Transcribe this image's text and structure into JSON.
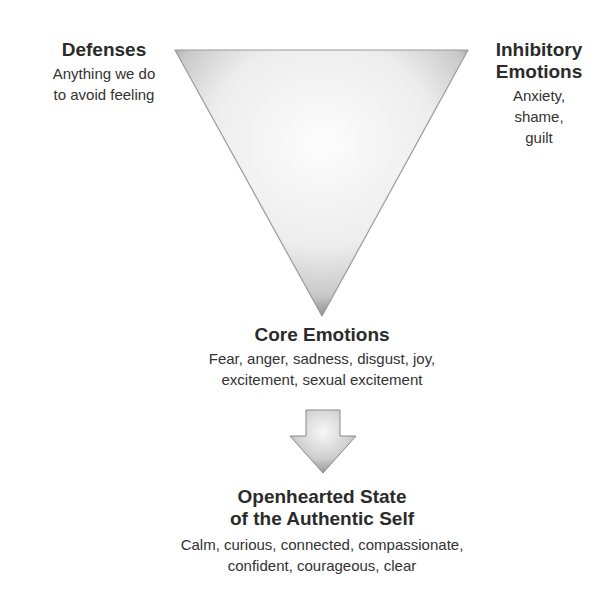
{
  "diagram": {
    "type": "triangle-of-experience",
    "top_left": {
      "title": "Defenses",
      "lines": [
        "Anything we do",
        "to avoid feeling"
      ]
    },
    "top_right": {
      "title_lines": [
        "Inhibitory",
        "Emotions"
      ],
      "lines": [
        "Anxiety,",
        "shame,",
        "guilt"
      ]
    },
    "bottom": {
      "title": "Core Emotions",
      "lines": [
        "Fear, anger, sadness, disgust, joy,",
        "excitement, sexual excitement"
      ]
    },
    "arrow": {
      "icon": "down-arrow-icon",
      "direction": "down"
    },
    "result": {
      "title_lines": [
        "Openhearted State",
        "of the Authentic Self"
      ],
      "lines": [
        "Calm, curious, connected, compassionate,",
        "confident, courageous, clear"
      ]
    },
    "colors": {
      "triangle_edge": "#8a8a8a",
      "triangle_fill": "#f4f4f4",
      "arrow_edge": "#7a7a7a",
      "text": "#2b2b2b"
    }
  }
}
